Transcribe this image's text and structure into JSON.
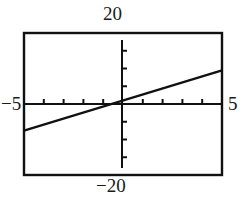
{
  "figure": {
    "kind": "graphing-calculator-window",
    "background": "#ffffff",
    "ink": "#111111"
  },
  "labels": {
    "ymax": "20",
    "ymin": "−20",
    "xmin": "−5",
    "xmax": "5"
  },
  "frame": {
    "x": 24,
    "y": 33,
    "width": 198,
    "height": 142,
    "stroke": "#111111",
    "stroke_width": 2.4
  },
  "axes": {
    "x_axis_pixel_y": 104,
    "y_axis_pixel_x": 122,
    "y_axis_top_pixel": 40,
    "y_axis_bottom_pixel": 168,
    "x_tick_len": 5,
    "y_tick_len": 5,
    "stroke_width": 2.0
  },
  "chart_data": {
    "type": "line",
    "title": "",
    "xlabel": "",
    "ylabel": "",
    "xlim": [
      -5,
      5
    ],
    "ylim": [
      -20,
      20
    ],
    "xscale": 1,
    "yscale": 5,
    "grid": false,
    "legend": null,
    "x_tick_values": [
      -4,
      -3,
      -2,
      -1,
      0,
      1,
      2,
      3,
      4
    ],
    "y_tick_values": [
      -15,
      -10,
      -5,
      0,
      5,
      10,
      15
    ],
    "series": [
      {
        "name": "line",
        "slope": 1.7,
        "intercept": 1.0,
        "x_intercept": -0.59,
        "x": [
          -5,
          5
        ],
        "values": [
          -7.5,
          9.5
        ]
      }
    ]
  }
}
